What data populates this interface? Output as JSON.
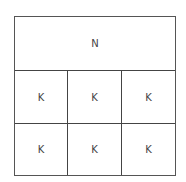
{
  "diagram": {
    "header_label": "N",
    "rows": [
      [
        "K",
        "K",
        "K"
      ],
      [
        "K",
        "K",
        "K"
      ]
    ]
  }
}
